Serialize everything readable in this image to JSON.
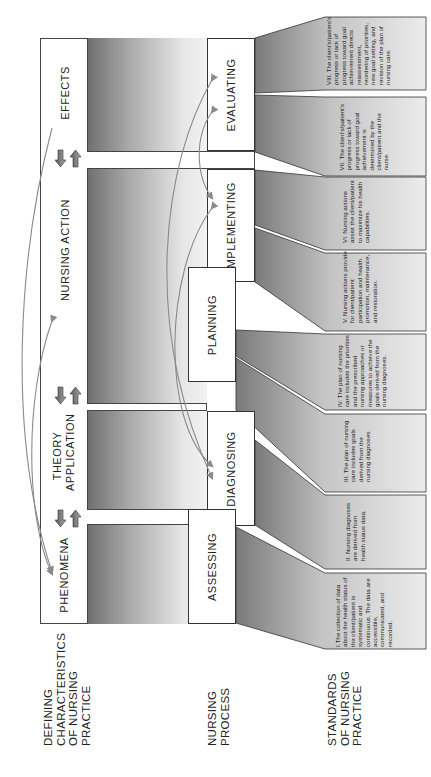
{
  "diagram": {
    "orientation": "rotated -90deg (reads bottom-to-top)",
    "colors": {
      "gradient_dark": "#6e6e6e",
      "gradient_light": "#f2f2f2",
      "box_border": "#333333",
      "arrow": "#8a8a8a",
      "text": "#222222"
    },
    "defining_characteristics": {
      "items": [
        {
          "label": "PHENOMENA"
        },
        {
          "label": "THEORY APPLICATION",
          "line1": "THEORY",
          "line2": "APPLICATION"
        },
        {
          "label": "NURSING ACTION"
        },
        {
          "label": "EFFECTS"
        }
      ],
      "bidirectional_arrows": 3
    },
    "nursing_process": {
      "steps": [
        {
          "label": "ASSESSING"
        },
        {
          "label": "DIAGNOSING"
        },
        {
          "label": "PLANNING"
        },
        {
          "label": "IMPLEMENTING"
        },
        {
          "label": "EVALUATING"
        }
      ]
    },
    "standards": {
      "items": [
        {
          "number": "I.",
          "text": "I.The collection of data about the health status of the client/patient is systematic and continuous. The data are accessible, communicated, and recorded."
        },
        {
          "number": "II.",
          "text": "II. Nursing diagnoses are derived from health status data."
        },
        {
          "number": "III.",
          "text": "III. The plan of nursing care includes goals derived from the nursing diagnoses."
        },
        {
          "number": "IV.",
          "text": "IV. The plan of nursing care includes the priorities and the prescribed nursing approaches or measures to achieve the goals derived from the nursing diagnoses."
        },
        {
          "number": "V.",
          "text": "V. Nursing actions provide for client/patient participation and health promotion, maintenance, and restoration."
        },
        {
          "number": "VI.",
          "text": "VI. Nursing actions assist the client/patient to maximize his health capabilities."
        },
        {
          "number": "VII.",
          "text": "VII. The client's/patient's progress or lack of progress toward goal achievement is determined by the client/patient and the nurse."
        },
        {
          "number": "VIII.",
          "text": "VIII. The client's/patient's progress or lack of progress toward goal achievement directs reassessment, reordering of priorities, new goal setting, and revision of the plan of nursing care."
        }
      ]
    },
    "row_labels": {
      "defining": "DEFINING CHARACTERISTICS OF NURSING PRACTICE",
      "defining_lines": [
        "DEFINING",
        "CHARACTERISTICS",
        "OF NURSING",
        "PRACTICE"
      ],
      "process": "NURSING PROCESS",
      "process_lines": [
        "NURSING",
        "PROCESS"
      ],
      "standards": "STANDARDS OF NURSING PRACTICE",
      "standards_lines": [
        "STANDARDS",
        "OF NURSING",
        "PRACTICE"
      ]
    }
  }
}
